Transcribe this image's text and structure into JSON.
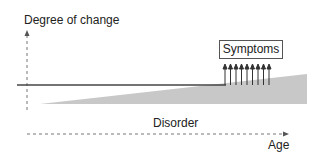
{
  "diagram": {
    "y_axis_label": "Degree of change",
    "x_axis_label": "Age",
    "region_label": "Disorder",
    "box_label": "Symptoms",
    "arrow_count": 9,
    "colors": {
      "wedge": "#c8c8c8",
      "line": "#444444",
      "axis": "#777777"
    }
  }
}
